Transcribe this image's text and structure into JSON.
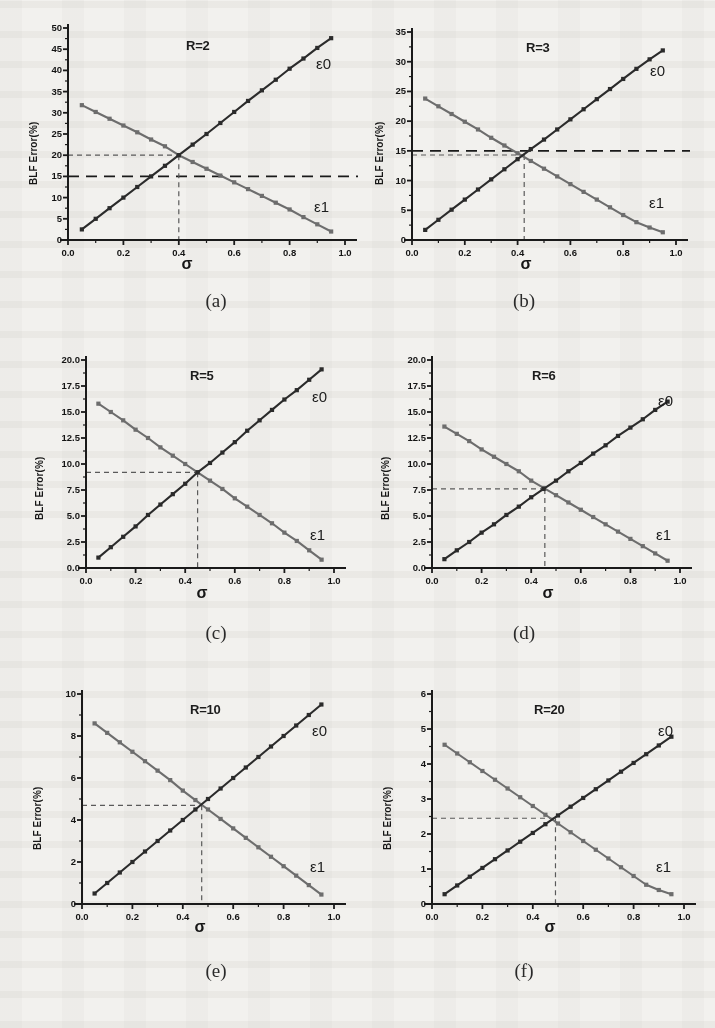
{
  "figure": {
    "ylabel": "BLF Error(%)",
    "xlabel": "σ",
    "series_labels": {
      "e0": "ε0",
      "e1": "ε1"
    },
    "colors": {
      "e0": "#2b2b2b",
      "e1": "#6d6d6d",
      "guide": "#5a5a5a",
      "axis": "#1a1a1a",
      "paper": "#f2f1ee"
    }
  },
  "captions": [
    "(a)",
    "(b)",
    "(c)",
    "(d)",
    "(e)",
    "(f)"
  ],
  "chart_data": [
    {
      "type": "line",
      "id": "a",
      "caption": "(a)",
      "title": "R=2",
      "xlabel": "σ",
      "ylabel": "BLF Error(%)",
      "xlim": [
        0.0,
        1.0
      ],
      "ylim": [
        0,
        50
      ],
      "xticks": [
        "0.0",
        "0.2",
        "0.4",
        "0.6",
        "0.8",
        "1.0"
      ],
      "xtickvals": [
        0.0,
        0.2,
        0.4,
        0.6,
        0.8,
        1.0
      ],
      "yticks": [
        "0",
        "5",
        "10",
        "15",
        "20",
        "25",
        "30",
        "35",
        "40",
        "45",
        "50"
      ],
      "ytickvals": [
        0,
        5,
        10,
        15,
        20,
        25,
        30,
        35,
        40,
        45,
        50
      ],
      "grid": false,
      "legend_position": "inline-end-of-line",
      "x": [
        0.05,
        0.1,
        0.15,
        0.2,
        0.25,
        0.3,
        0.35,
        0.4,
        0.45,
        0.5,
        0.55,
        0.6,
        0.65,
        0.7,
        0.75,
        0.8,
        0.85,
        0.9,
        0.95
      ],
      "series": [
        {
          "name": "ε0",
          "values": [
            2.5,
            5.0,
            7.5,
            10.0,
            12.5,
            15.0,
            17.5,
            20.0,
            22.5,
            25.0,
            27.6,
            30.2,
            32.8,
            35.3,
            37.8,
            40.4,
            42.8,
            45.3,
            47.6
          ]
        },
        {
          "name": "ε1",
          "values": [
            31.8,
            30.2,
            28.6,
            27.0,
            25.4,
            23.7,
            22.1,
            20.0,
            18.4,
            16.8,
            15.2,
            13.6,
            12.0,
            10.4,
            8.8,
            7.2,
            5.4,
            3.7,
            2.0
          ]
        }
      ],
      "annotations": {
        "crossing": {
          "x": 0.4,
          "y": 20.0
        },
        "guide_h_short": 20.0,
        "guide_h_full": 15.0,
        "guide_v": 0.4
      }
    },
    {
      "type": "line",
      "id": "b",
      "caption": "(b)",
      "title": "R=3",
      "xlabel": "σ",
      "ylabel": "BLF Error(%)",
      "xlim": [
        0.0,
        1.0
      ],
      "ylim": [
        0,
        35
      ],
      "xticks": [
        "0.0",
        "0.2",
        "0.4",
        "0.6",
        "0.8",
        "1.0"
      ],
      "xtickvals": [
        0.0,
        0.2,
        0.4,
        0.6,
        0.8,
        1.0
      ],
      "yticks": [
        "0",
        "5",
        "10",
        "15",
        "20",
        "25",
        "30",
        "35"
      ],
      "ytickvals": [
        0,
        5,
        10,
        15,
        20,
        25,
        30,
        35
      ],
      "grid": false,
      "legend_position": "inline-end-of-line",
      "x": [
        0.05,
        0.1,
        0.15,
        0.2,
        0.25,
        0.3,
        0.35,
        0.4,
        0.45,
        0.5,
        0.55,
        0.6,
        0.65,
        0.7,
        0.75,
        0.8,
        0.85,
        0.9,
        0.95
      ],
      "series": [
        {
          "name": "ε0",
          "values": [
            1.7,
            3.4,
            5.1,
            6.8,
            8.5,
            10.2,
            11.9,
            13.6,
            15.3,
            16.9,
            18.6,
            20.3,
            22.0,
            23.7,
            25.4,
            27.1,
            28.8,
            30.4,
            31.9
          ]
        },
        {
          "name": "ε1",
          "values": [
            23.8,
            22.5,
            21.2,
            19.9,
            18.6,
            17.2,
            15.9,
            14.6,
            13.3,
            12.0,
            10.7,
            9.4,
            8.1,
            6.8,
            5.5,
            4.2,
            3.0,
            2.1,
            1.3
          ]
        }
      ],
      "annotations": {
        "crossing": {
          "x": 0.425,
          "y": 14.3
        },
        "guide_h_short": 14.3,
        "guide_h_full": 15.0,
        "guide_v": 0.425
      }
    },
    {
      "type": "line",
      "id": "c",
      "caption": "(c)",
      "title": "R=5",
      "xlabel": "σ",
      "ylabel": "BLF Error(%)",
      "xlim": [
        0.0,
        1.0
      ],
      "ylim": [
        0,
        20
      ],
      "xticks": [
        "0.0",
        "0.2",
        "0.4",
        "0.6",
        "0.8",
        "1.0"
      ],
      "xtickvals": [
        0.0,
        0.2,
        0.4,
        0.6,
        0.8,
        1.0
      ],
      "yticks": [
        "0.0",
        "2.5",
        "5.0",
        "7.5",
        "10.0",
        "12.5",
        "15.0",
        "17.5",
        "20.0"
      ],
      "ytickvals": [
        0,
        2.5,
        5,
        7.5,
        10,
        12.5,
        15,
        17.5,
        20
      ],
      "grid": false,
      "legend_position": "inline-end-of-line",
      "x": [
        0.05,
        0.1,
        0.15,
        0.2,
        0.25,
        0.3,
        0.35,
        0.4,
        0.45,
        0.5,
        0.55,
        0.6,
        0.65,
        0.7,
        0.75,
        0.8,
        0.85,
        0.9,
        0.95
      ],
      "series": [
        {
          "name": "ε0",
          "values": [
            1.0,
            2.0,
            3.0,
            4.0,
            5.1,
            6.1,
            7.1,
            8.1,
            9.2,
            10.1,
            11.1,
            12.1,
            13.2,
            14.2,
            15.2,
            16.2,
            17.1,
            18.1,
            19.1
          ]
        },
        {
          "name": "ε1",
          "values": [
            15.8,
            15.0,
            14.2,
            13.3,
            12.5,
            11.6,
            10.8,
            10.0,
            9.2,
            8.4,
            7.6,
            6.7,
            5.9,
            5.1,
            4.3,
            3.4,
            2.6,
            1.7,
            0.8
          ]
        }
      ],
      "annotations": {
        "crossing": {
          "x": 0.45,
          "y": 9.2
        },
        "guide_h_short": 9.2,
        "guide_h_full": null,
        "guide_v": 0.45
      }
    },
    {
      "type": "line",
      "id": "d",
      "caption": "(d)",
      "title": "R=6",
      "xlabel": "σ",
      "ylabel": "BLF Error(%)",
      "xlim": [
        0.0,
        1.0
      ],
      "ylim": [
        0,
        20
      ],
      "xticks": [
        "0.0",
        "0.2",
        "0.4",
        "0.6",
        "0.8",
        "1.0"
      ],
      "xtickvals": [
        0.0,
        0.2,
        0.4,
        0.6,
        0.8,
        1.0
      ],
      "yticks": [
        "0.0",
        "2.5",
        "5.0",
        "7.5",
        "10.0",
        "12.5",
        "15.0",
        "17.5",
        "20.0"
      ],
      "ytickvals": [
        0,
        2.5,
        5,
        7.5,
        10,
        12.5,
        15,
        17.5,
        20
      ],
      "grid": false,
      "legend_position": "inline-end-of-line",
      "x": [
        0.05,
        0.1,
        0.15,
        0.2,
        0.25,
        0.3,
        0.35,
        0.4,
        0.45,
        0.5,
        0.55,
        0.6,
        0.65,
        0.7,
        0.75,
        0.8,
        0.85,
        0.9,
        0.95
      ],
      "series": [
        {
          "name": "ε0",
          "values": [
            0.85,
            1.7,
            2.5,
            3.4,
            4.2,
            5.1,
            5.9,
            6.8,
            7.6,
            8.4,
            9.3,
            10.1,
            11.0,
            11.8,
            12.7,
            13.5,
            14.3,
            15.2,
            16.0
          ]
        },
        {
          "name": "ε1",
          "values": [
            13.6,
            12.9,
            12.2,
            11.4,
            10.7,
            10.0,
            9.3,
            8.4,
            7.7,
            7.0,
            6.3,
            5.6,
            4.9,
            4.2,
            3.5,
            2.8,
            2.1,
            1.4,
            0.7
          ]
        }
      ],
      "annotations": {
        "crossing": {
          "x": 0.455,
          "y": 7.6
        },
        "guide_h_short": 7.6,
        "guide_h_full": null,
        "guide_v": 0.455
      }
    },
    {
      "type": "line",
      "id": "e",
      "caption": "(e)",
      "title": "R=10",
      "xlabel": "σ",
      "ylabel": "BLF Error(%)",
      "xlim": [
        0.0,
        1.0
      ],
      "ylim": [
        0,
        10
      ],
      "xticks": [
        "0.0",
        "0.2",
        "0.4",
        "0.6",
        "0.8",
        "1.0"
      ],
      "xtickvals": [
        0.0,
        0.2,
        0.4,
        0.6,
        0.8,
        1.0
      ],
      "yticks": [
        "0",
        "2",
        "4",
        "6",
        "8",
        "10"
      ],
      "ytickvals": [
        0,
        2,
        4,
        6,
        8,
        10
      ],
      "grid": false,
      "legend_position": "inline-end-of-line",
      "x": [
        0.05,
        0.1,
        0.15,
        0.2,
        0.25,
        0.3,
        0.35,
        0.4,
        0.45,
        0.5,
        0.55,
        0.6,
        0.65,
        0.7,
        0.75,
        0.8,
        0.85,
        0.9,
        0.95
      ],
      "series": [
        {
          "name": "ε0",
          "values": [
            0.5,
            1.0,
            1.5,
            2.0,
            2.5,
            3.0,
            3.5,
            4.0,
            4.5,
            5.0,
            5.5,
            6.0,
            6.5,
            7.0,
            7.5,
            8.0,
            8.5,
            9.0,
            9.5
          ]
        },
        {
          "name": "ε1",
          "values": [
            8.6,
            8.15,
            7.7,
            7.25,
            6.8,
            6.35,
            5.9,
            5.4,
            4.95,
            4.5,
            4.05,
            3.6,
            3.15,
            2.7,
            2.25,
            1.8,
            1.35,
            0.9,
            0.45
          ]
        }
      ],
      "annotations": {
        "crossing": {
          "x": 0.475,
          "y": 4.7
        },
        "guide_h_short": 4.7,
        "guide_h_full": null,
        "guide_v": 0.475
      }
    },
    {
      "type": "line",
      "id": "f",
      "caption": "(f)",
      "title": "R=20",
      "xlabel": "σ",
      "ylabel": "BLF Error(%)",
      "xlim": [
        0.0,
        1.0
      ],
      "ylim": [
        0,
        6
      ],
      "xticks": [
        "0.0",
        "0.2",
        "0.4",
        "0.6",
        "0.8",
        "1.0"
      ],
      "xtickvals": [
        0.0,
        0.2,
        0.4,
        0.6,
        0.8,
        1.0
      ],
      "yticks": [
        "0",
        "1",
        "2",
        "3",
        "4",
        "5",
        "6"
      ],
      "ytickvals": [
        0,
        1,
        2,
        3,
        4,
        5,
        6
      ],
      "grid": false,
      "legend_position": "inline-end-of-line",
      "x": [
        0.05,
        0.1,
        0.15,
        0.2,
        0.25,
        0.3,
        0.35,
        0.4,
        0.45,
        0.5,
        0.55,
        0.6,
        0.65,
        0.7,
        0.75,
        0.8,
        0.85,
        0.9,
        0.95
      ],
      "series": [
        {
          "name": "ε0",
          "values": [
            0.28,
            0.53,
            0.78,
            1.03,
            1.28,
            1.53,
            1.78,
            2.03,
            2.28,
            2.53,
            2.78,
            3.03,
            3.28,
            3.53,
            3.78,
            4.03,
            4.28,
            4.53,
            4.78
          ]
        },
        {
          "name": "ε1",
          "values": [
            4.55,
            4.3,
            4.05,
            3.8,
            3.55,
            3.3,
            3.05,
            2.8,
            2.55,
            2.3,
            2.05,
            1.8,
            1.55,
            1.3,
            1.05,
            0.8,
            0.55,
            0.4,
            0.28
          ]
        }
      ],
      "annotations": {
        "crossing": {
          "x": 0.49,
          "y": 2.45
        },
        "guide_h_short": 2.45,
        "guide_h_full": null,
        "guide_v": 0.49
      }
    }
  ]
}
